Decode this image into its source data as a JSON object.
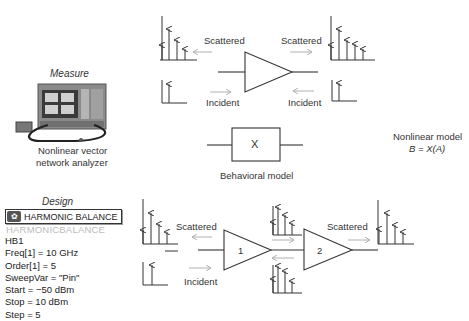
{
  "measure": {
    "title": "Measure",
    "instrument_label_line1": "Nonlinear vector",
    "instrument_label_line2": "network analyzer"
  },
  "design": {
    "title": "Design",
    "component_button": "HARMONIC BALANCE",
    "component_name_ghost": "HARMONICBALANCE",
    "instance": "HB1",
    "params": [
      "Freq[1] = 10 GHz",
      "Order[1] = 5",
      "SweepVar = \"Pin\"",
      "Start = −50 dBm",
      "Stop = 10 dBm",
      "Step = 5"
    ]
  },
  "top_diagram": {
    "scattered_left": "Scattered",
    "scattered_right": "Scattered",
    "incident_left": "Incident",
    "incident_right": "Incident"
  },
  "behavioral": {
    "box_label": "X",
    "caption": "Behavioral model"
  },
  "model": {
    "line1": "Nonlinear model",
    "line2": "B = X(A)"
  },
  "bottom_diagram": {
    "scattered_left": "Scattered",
    "scattered_right": "Scattered",
    "incident_left": "Incident",
    "amp1_label": "1",
    "amp2_label": "2"
  },
  "colors": {
    "line": "#333333",
    "arrow_faint": "#b0b0b0",
    "text": "#333333"
  }
}
